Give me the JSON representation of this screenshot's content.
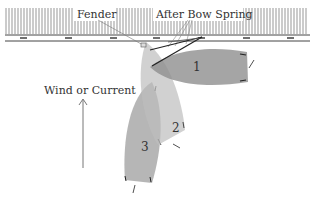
{
  "diagram": {
    "type": "boat-docking-maneuver",
    "labels": {
      "fender": "Fender",
      "after_bow_spring": "After Bow Spring",
      "wind": "Wind or Current"
    },
    "boats": [
      {
        "id": "1",
        "label": "1",
        "color": "#9a9a9a"
      },
      {
        "id": "2",
        "label": "2",
        "color": "#c4c4c4"
      },
      {
        "id": "3",
        "label": "3",
        "color": "#a8a8a8"
      }
    ],
    "colors": {
      "dock_line": "#444444",
      "piling": "#666666",
      "text": "#333333",
      "arrow": "#777777",
      "spring_line": "#222222"
    }
  }
}
